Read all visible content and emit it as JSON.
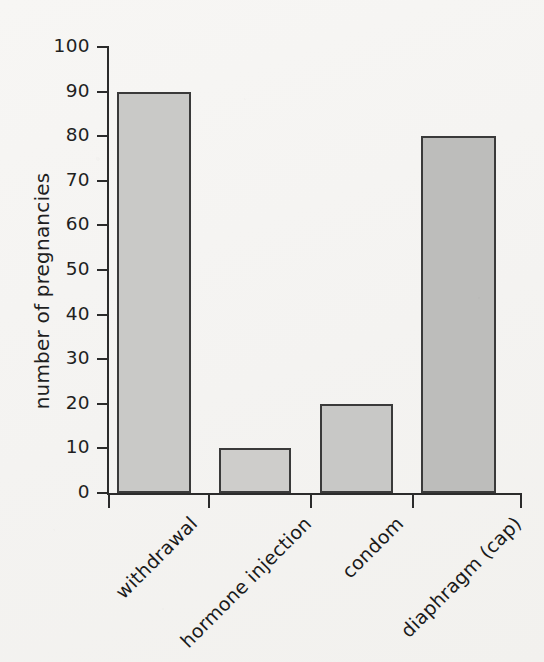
{
  "chart_data": {
    "type": "bar",
    "title": "",
    "subtitle": "",
    "xlabel": "",
    "ylabel": "number of pregnancies",
    "categories": [
      "withdrawal",
      "hormone injection",
      "condom",
      "diaphragm (cap)"
    ],
    "values": [
      90,
      10,
      20,
      80
    ],
    "series": [
      {
        "name": "number of pregnancies",
        "values": [
          90,
          10,
          20,
          80
        ]
      }
    ],
    "ylim": [
      0,
      100
    ],
    "y_ticks": [
      0,
      10,
      20,
      30,
      40,
      50,
      60,
      70,
      80,
      90,
      100
    ],
    "y_tick_labels": [
      "0",
      "10",
      "20",
      "30",
      "40",
      "50",
      "60",
      "70",
      "80",
      "90",
      "100"
    ],
    "grid": false,
    "legend": false,
    "legend_position": "none",
    "annotations": [],
    "bar_colors": [
      "#c9c9c7",
      "#cecdcb",
      "#c8c8c6",
      "#bdbdbb"
    ],
    "bar_edge_color": "#3a3a3a",
    "axis_color": "#2b2b2b",
    "background_color": "#f6f5f3",
    "x_tick_label_rotation": -45
  },
  "axis": {
    "y_title": "number of pregnancies",
    "ticks": [
      {
        "label": "100",
        "value": 100
      },
      {
        "label": "90",
        "value": 90
      },
      {
        "label": "80",
        "value": 80
      },
      {
        "label": "70",
        "value": 70
      },
      {
        "label": "60",
        "value": 60
      },
      {
        "label": "50",
        "value": 50
      },
      {
        "label": "40",
        "value": 40
      },
      {
        "label": "30",
        "value": 30
      },
      {
        "label": "20",
        "value": 20
      },
      {
        "label": "10",
        "value": 10
      },
      {
        "label": "0",
        "value": 0
      }
    ]
  },
  "bars": [
    {
      "label": "withdrawal",
      "value": 90
    },
    {
      "label": "hormone injection",
      "value": 10
    },
    {
      "label": "condom",
      "value": 20
    },
    {
      "label": "diaphragm (cap)",
      "value": 80
    }
  ]
}
